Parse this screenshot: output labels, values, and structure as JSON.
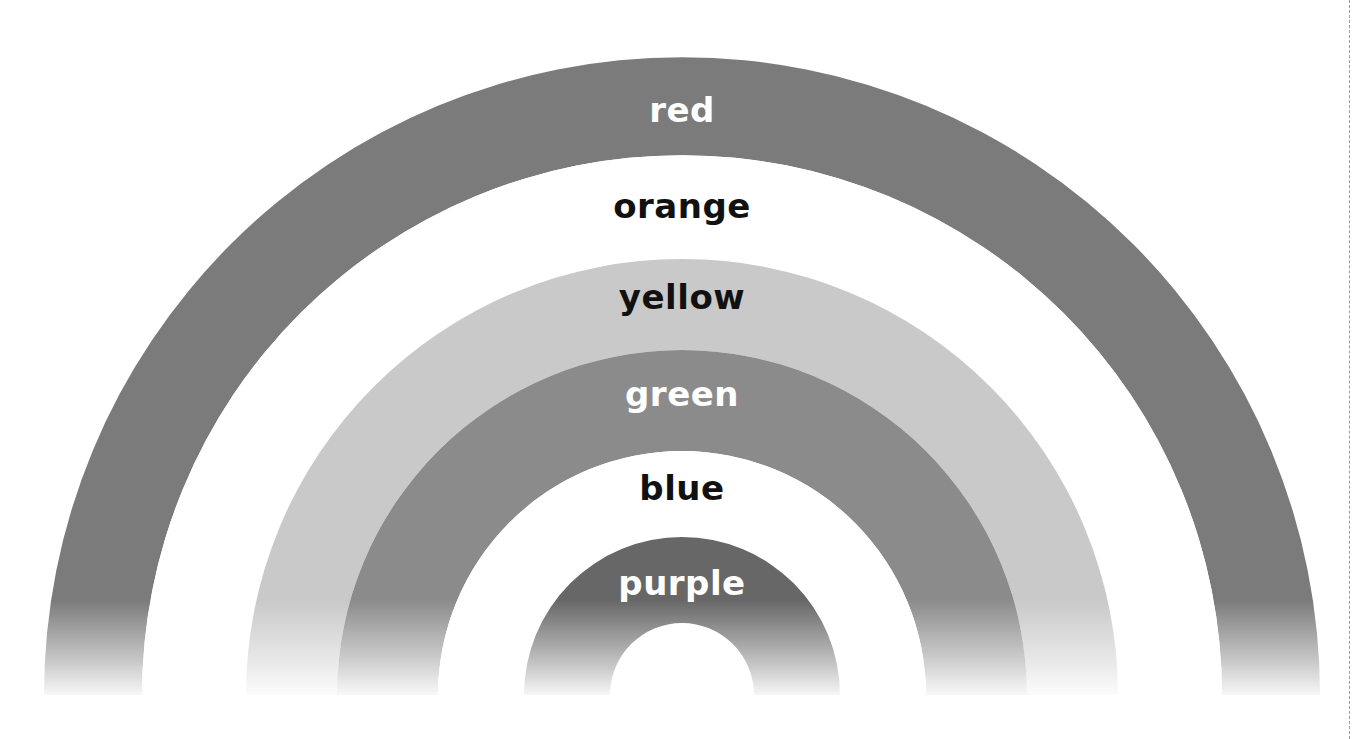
{
  "diagram": {
    "type": "rainbow-arcs",
    "center": {
      "x": 682,
      "y": 695
    },
    "bands": [
      {
        "name": "red",
        "label": "red",
        "outer_radius": 638,
        "inner_radius": 540,
        "fill": "#7b7b7b",
        "text_color": "#ffffff",
        "label_y": 112
      },
      {
        "name": "orange",
        "label": "orange",
        "outer_radius": 540,
        "inner_radius": 436,
        "fill": "#ffffff",
        "text_color": "#111111",
        "label_y": 208
      },
      {
        "name": "yellow",
        "label": "yellow",
        "outer_radius": 436,
        "inner_radius": 345,
        "fill": "#c9c9c9",
        "text_color": "#111111",
        "label_y": 299
      },
      {
        "name": "green",
        "label": "green",
        "outer_radius": 345,
        "inner_radius": 244,
        "fill": "#8b8b8b",
        "text_color": "#ffffff",
        "label_y": 396
      },
      {
        "name": "blue",
        "label": "blue",
        "outer_radius": 244,
        "inner_radius": 158,
        "fill": "#ffffff",
        "text_color": "#111111",
        "label_y": 490
      },
      {
        "name": "purple",
        "label": "purple",
        "outer_radius": 158,
        "inner_radius": 72,
        "fill": "#676767",
        "text_color": "#ffffff",
        "label_y": 585
      }
    ]
  }
}
